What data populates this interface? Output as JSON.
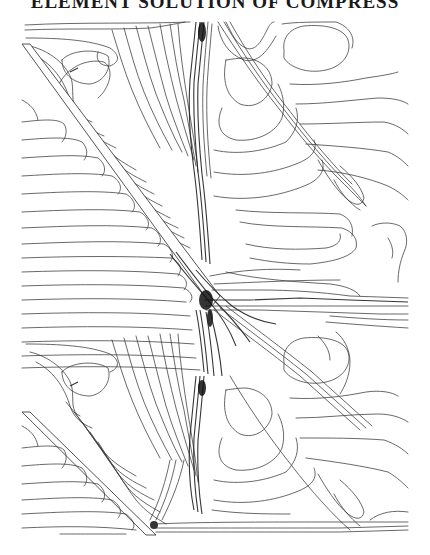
{
  "page": {
    "header_text": "ELEMENT SOLUTION OF COMPRESS",
    "header_visible_fragment": "...ELEMENT SOLUTION OF COMPRESS..."
  },
  "figure": {
    "type": "contour-plot",
    "line_color": "#3a3a3a",
    "background": "#ffffff",
    "blades": [
      {
        "name": "upper-blade",
        "leading_edge": [
          22,
          45
        ],
        "trailing_edge": [
          215,
          300
        ]
      },
      {
        "name": "lower-blade",
        "leading_edge": [
          22,
          413
        ],
        "trailing_edge": [
          150,
          535
        ]
      }
    ],
    "features": [
      {
        "name": "trailing-edge-singularity",
        "position": [
          208,
          300
        ],
        "note": "dense dark contour cluster"
      },
      {
        "name": "wake-lines",
        "region": "from trailing edge toward right boundary"
      },
      {
        "name": "closed-loop-upper-right",
        "position": [
          300,
          75
        ]
      },
      {
        "name": "closed-loop-right-mid",
        "position": [
          250,
          100
        ]
      },
      {
        "name": "closed-loop-lower-middle",
        "position": [
          250,
          400
        ]
      },
      {
        "name": "closed-loop-lower-right",
        "position": [
          315,
          360
        ]
      }
    ],
    "domain_bounds": {
      "x_min": 22,
      "x_max": 410,
      "y_min": 22,
      "y_max": 535
    }
  }
}
